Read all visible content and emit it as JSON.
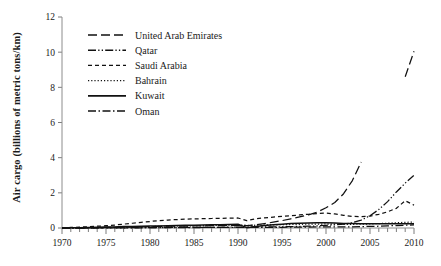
{
  "chart_data": {
    "type": "line",
    "title": "",
    "xlabel": "",
    "ylabel": "Air cargo (billions of metric tons/km)",
    "xlim": [
      1970,
      2010
    ],
    "ylim": [
      0,
      12
    ],
    "xticks": [
      1970,
      1975,
      1980,
      1985,
      1990,
      1995,
      2000,
      2005,
      2010
    ],
    "xtick_labels": [
      "1970",
      "1975",
      "1980",
      "1985",
      "1990",
      "1995",
      "2000",
      "2005",
      "2010"
    ],
    "minor_xtick_step": 1,
    "yticks": [
      0,
      2,
      4,
      6,
      8,
      10,
      12
    ],
    "ytick_labels": [
      "0",
      "2",
      "4",
      "6",
      "8",
      "10",
      "12"
    ],
    "grid": false,
    "legend_position": "top-left",
    "x": [
      1970,
      1971,
      1972,
      1973,
      1974,
      1975,
      1976,
      1977,
      1978,
      1979,
      1980,
      1981,
      1982,
      1983,
      1984,
      1985,
      1986,
      1987,
      1988,
      1989,
      1990,
      1991,
      1992,
      1993,
      1994,
      1995,
      1996,
      1997,
      1998,
      1999,
      2000,
      2001,
      2002,
      2003,
      2004,
      2005,
      2006,
      2007,
      2008,
      2009,
      2010
    ],
    "series": [
      {
        "name": "United Arab Emirates",
        "dash": "long-dash",
        "values": [
          0.0,
          0.01,
          0.01,
          0.02,
          0.02,
          0.03,
          0.04,
          0.05,
          0.06,
          0.07,
          0.08,
          0.09,
          0.1,
          0.1,
          0.11,
          0.12,
          0.12,
          0.13,
          0.14,
          0.15,
          0.16,
          0.14,
          0.18,
          0.25,
          0.33,
          0.42,
          0.52,
          0.63,
          0.75,
          0.9,
          1.15,
          1.45,
          1.95,
          2.7,
          3.75,
          null,
          null,
          null,
          null,
          8.6,
          10.05
        ]
      },
      {
        "name": "Qatar",
        "dash": "dash-dot-dot",
        "values": [
          0.0,
          0.0,
          0.0,
          0.0,
          0.01,
          0.01,
          0.01,
          0.01,
          0.02,
          0.02,
          0.02,
          0.02,
          0.03,
          0.03,
          0.03,
          0.03,
          0.04,
          0.04,
          0.04,
          0.05,
          0.05,
          0.05,
          0.06,
          0.06,
          0.07,
          0.07,
          0.08,
          0.09,
          0.1,
          0.12,
          0.15,
          0.18,
          0.22,
          0.3,
          0.45,
          0.7,
          1.05,
          1.5,
          2.05,
          2.55,
          3.0
        ]
      },
      {
        "name": "Saudi Arabia",
        "dash": "short-dash",
        "values": [
          0.02,
          0.03,
          0.05,
          0.07,
          0.1,
          0.13,
          0.17,
          0.22,
          0.27,
          0.32,
          0.37,
          0.42,
          0.45,
          0.48,
          0.5,
          0.52,
          0.53,
          0.54,
          0.55,
          0.56,
          0.57,
          0.42,
          0.52,
          0.58,
          0.62,
          0.66,
          0.7,
          0.74,
          0.78,
          0.82,
          0.85,
          0.8,
          0.72,
          0.66,
          0.64,
          0.68,
          0.78,
          0.92,
          1.12,
          1.55,
          1.3
        ]
      },
      {
        "name": "Bahrain",
        "dash": "dotted",
        "values": [
          0.0,
          0.01,
          0.01,
          0.02,
          0.02,
          0.03,
          0.04,
          0.05,
          0.06,
          0.07,
          0.08,
          0.09,
          0.1,
          0.11,
          0.12,
          0.13,
          0.14,
          0.15,
          0.16,
          0.17,
          0.18,
          0.14,
          0.16,
          0.17,
          0.18,
          0.19,
          0.2,
          0.21,
          0.22,
          0.22,
          0.23,
          0.22,
          0.21,
          0.21,
          0.22,
          0.23,
          0.25,
          0.27,
          0.3,
          0.32,
          0.34
        ]
      },
      {
        "name": "Kuwait",
        "dash": "solid",
        "values": [
          0.01,
          0.01,
          0.02,
          0.03,
          0.04,
          0.05,
          0.06,
          0.08,
          0.09,
          0.1,
          0.11,
          0.12,
          0.13,
          0.14,
          0.15,
          0.16,
          0.17,
          0.18,
          0.19,
          0.2,
          0.21,
          0.02,
          0.08,
          0.14,
          0.18,
          0.22,
          0.25,
          0.27,
          0.29,
          0.3,
          0.3,
          0.28,
          0.26,
          0.25,
          0.24,
          0.24,
          0.24,
          0.24,
          0.24,
          0.24,
          0.24
        ]
      },
      {
        "name": "Oman",
        "dash": "dash-dot",
        "values": [
          0.0,
          0.0,
          0.0,
          0.0,
          0.0,
          0.01,
          0.01,
          0.01,
          0.01,
          0.01,
          0.02,
          0.02,
          0.02,
          0.02,
          0.02,
          0.02,
          0.03,
          0.03,
          0.03,
          0.03,
          0.03,
          0.03,
          0.03,
          0.04,
          0.04,
          0.04,
          0.05,
          0.05,
          0.05,
          0.06,
          0.06,
          0.06,
          0.07,
          0.07,
          0.08,
          0.09,
          0.1,
          0.12,
          0.14,
          0.16,
          0.18
        ]
      }
    ]
  },
  "legend": {
    "items": [
      {
        "label": "United Arab Emirates",
        "dash": "long-dash"
      },
      {
        "label": "Qatar",
        "dash": "dash-dot-dot"
      },
      {
        "label": "Saudi Arabia",
        "dash": "short-dash"
      },
      {
        "label": "Bahrain",
        "dash": "dotted"
      },
      {
        "label": "Kuwait",
        "dash": "solid"
      },
      {
        "label": "Oman",
        "dash": "dash-dot"
      }
    ]
  },
  "colors": {
    "line": "#111111",
    "axis": "#8c8c8c",
    "text": "#1a1a1a",
    "background": "#ffffff"
  }
}
